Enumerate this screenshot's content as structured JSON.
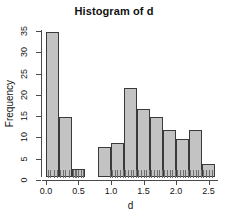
{
  "chart_data": {
    "type": "bar",
    "title": "Histogram of d",
    "xlabel": "d",
    "ylabel": "Frequency",
    "binwidth": 0.2,
    "bin_edges": [
      0.0,
      0.2,
      0.4,
      0.6,
      0.8,
      1.0,
      1.2,
      1.4,
      1.6,
      1.8,
      2.0,
      2.2,
      2.4,
      2.6
    ],
    "categories": [
      "0.0-0.2",
      "0.2-0.4",
      "0.4-0.6",
      "0.6-0.8",
      "0.8-1.0",
      "1.0-1.2",
      "1.2-1.4",
      "1.4-1.6",
      "1.6-1.8",
      "1.8-2.0",
      "2.0-2.2",
      "2.2-2.4",
      "2.4-2.6"
    ],
    "values": [
      34,
      14,
      2,
      0,
      7,
      8,
      21,
      16,
      14,
      11,
      9,
      11,
      3
    ],
    "xlim": [
      -0.06,
      2.66
    ],
    "ylim": [
      0,
      35
    ],
    "grid": false,
    "legend": null,
    "bar_fill_color": "#c3c3c3",
    "bar_border_color": "#3a3a3a",
    "axis_color": "#4a4a4a",
    "text_color": "#141414",
    "background_color": "#ffffff",
    "xticks": [
      {
        "value": 0.0,
        "label": "0.0"
      },
      {
        "value": 0.5,
        "label": "0.5"
      },
      {
        "value": 1.0,
        "label": "1.0"
      },
      {
        "value": 1.5,
        "label": "1.5"
      },
      {
        "value": 2.0,
        "label": "2.0"
      },
      {
        "value": 2.5,
        "label": "2.5"
      }
    ],
    "yticks": [
      {
        "value": 0,
        "label": "0"
      },
      {
        "value": 5,
        "label": "5"
      },
      {
        "value": 10,
        "label": "10"
      },
      {
        "value": 15,
        "label": "15"
      },
      {
        "value": 20,
        "label": "20"
      },
      {
        "value": 25,
        "label": "25"
      },
      {
        "value": 30,
        "label": "30"
      },
      {
        "value": 35,
        "label": "35"
      }
    ],
    "rug_values": [
      0.03,
      0.07,
      0.12,
      0.17,
      0.21,
      0.26,
      0.3,
      0.35,
      0.41,
      0.44,
      0.47,
      0.5,
      0.54,
      0.57,
      0.98,
      1.02,
      1.06,
      1.1,
      1.14,
      1.18,
      1.22,
      1.26,
      1.3,
      1.34,
      1.38,
      1.42,
      1.46,
      1.5,
      1.54,
      1.58,
      1.62,
      1.66,
      1.7,
      1.74,
      1.78,
      1.82,
      1.86,
      1.9,
      1.94,
      1.98,
      2.02,
      2.06,
      2.1,
      2.14,
      2.18,
      2.22,
      2.26,
      2.3,
      2.34,
      2.38,
      2.42,
      2.46,
      2.5,
      2.55
    ]
  }
}
